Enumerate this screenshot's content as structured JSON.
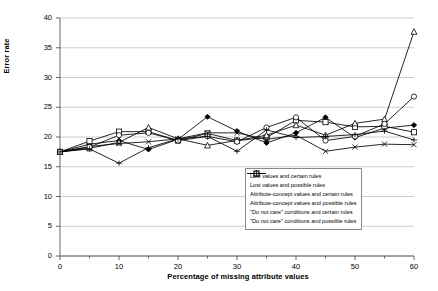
{
  "chart_data": {
    "type": "line",
    "title": "",
    "xlabel": "Percentage of missing attribute values",
    "ylabel": "Error rate",
    "xlim": [
      0,
      60
    ],
    "ylim": [
      0,
      40
    ],
    "xticks": [
      0,
      10,
      20,
      30,
      40,
      50,
      60
    ],
    "yticks": [
      0,
      5,
      10,
      15,
      20,
      25,
      30,
      35,
      40
    ],
    "grid": "horizontal",
    "legend_position": "lower-right-inside",
    "x": [
      0,
      5,
      10,
      15,
      20,
      25,
      30,
      35,
      40,
      45,
      50,
      55,
      60
    ],
    "series": [
      {
        "name": "Lost values and certain rules",
        "marker": "filled-diamond",
        "values": [
          17.5,
          18.8,
          19.4,
          17.9,
          19.6,
          23.4,
          21.0,
          19.0,
          20.7,
          23.3,
          19.9,
          21.5,
          22.0
        ]
      },
      {
        "name": "Lost values and possible rules",
        "marker": "open-square",
        "values": [
          17.5,
          19.3,
          20.9,
          20.9,
          19.4,
          20.6,
          19.4,
          19.9,
          22.8,
          22.5,
          21.7,
          21.8,
          20.8
        ]
      },
      {
        "name": "Attribute-concept values and certain rules",
        "marker": "open-triangle",
        "values": [
          17.5,
          18.1,
          19.1,
          21.6,
          19.7,
          18.6,
          19.4,
          20.3,
          22.0,
          20.3,
          22.3,
          23.0,
          37.7
        ]
      },
      {
        "name": "Attribute-concept values and possible rules",
        "marker": "cross-x",
        "values": [
          17.5,
          18.4,
          18.9,
          19.2,
          19.7,
          20.7,
          20.7,
          19.6,
          20.3,
          17.6,
          18.3,
          18.8,
          18.7
        ]
      },
      {
        "name": "\"Do not care\" conditions and certain rules",
        "marker": "open-circle",
        "values": [
          17.5,
          18.3,
          20.3,
          20.7,
          19.4,
          20.1,
          19.2,
          21.6,
          23.3,
          19.4,
          20.1,
          22.2,
          26.8
        ]
      },
      {
        "name": "\"Do not care\" conditions and possible rules",
        "marker": "plus",
        "values": [
          17.5,
          18.0,
          15.6,
          18.2,
          19.7,
          20.1,
          17.6,
          21.2,
          19.9,
          20.1,
          20.4,
          21.0,
          19.5
        ]
      }
    ]
  }
}
